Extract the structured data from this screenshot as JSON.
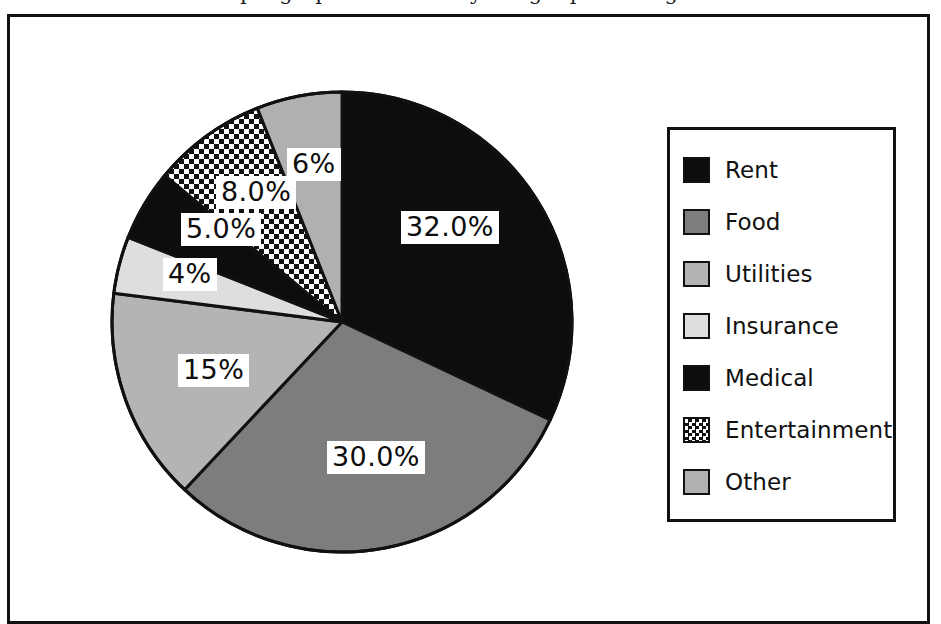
{
  "figure": {
    "clipped_title": "pie graph of a monthly budget percentages",
    "frame_color": "#111111",
    "background": "#ffffff"
  },
  "chart_data": {
    "type": "pie",
    "title": "",
    "xlabel": "",
    "ylabel": "",
    "grid": false,
    "legend_position": "right",
    "start_angle_deg": 90,
    "direction": "clockwise",
    "categories": [
      "Rent",
      "Food",
      "Utilities",
      "Insurance",
      "Medical",
      "Entertainment",
      "Other"
    ],
    "values": [
      32.0,
      30.0,
      15.0,
      4.0,
      5.0,
      8.0,
      6.0
    ],
    "labels": [
      "32.0%",
      "30.0%",
      "15%",
      "4%",
      "5.0%",
      "8.0%",
      "6%"
    ],
    "colors": [
      "#0d0d0d",
      "#7d7d7d",
      "#b4b4b4",
      "#dedede",
      "#0d0d0d",
      "#ffffff",
      "#b0b0b0"
    ],
    "patterns": [
      "solid",
      "solid",
      "solid",
      "solid",
      "solid",
      "checkerboard",
      "solid"
    ],
    "total": 100.0,
    "slices": [
      {
        "name": "Rent",
        "value": 32.0,
        "label": "32.0%",
        "color": "#0d0d0d",
        "pattern": "solid"
      },
      {
        "name": "Food",
        "value": 30.0,
        "label": "30.0%",
        "color": "#7d7d7d",
        "pattern": "solid"
      },
      {
        "name": "Utilities",
        "value": 15.0,
        "label": "15%",
        "color": "#b4b4b4",
        "pattern": "solid"
      },
      {
        "name": "Insurance",
        "value": 4.0,
        "label": "4%",
        "color": "#dedede",
        "pattern": "solid"
      },
      {
        "name": "Medical",
        "value": 5.0,
        "label": "5.0%",
        "color": "#0d0d0d",
        "pattern": "solid"
      },
      {
        "name": "Entertainment",
        "value": 8.0,
        "label": "8.0%",
        "color": "#ffffff",
        "pattern": "checkerboard"
      },
      {
        "name": "Other",
        "value": 6.0,
        "label": "6%",
        "color": "#b0b0b0",
        "pattern": "solid"
      }
    ]
  },
  "legend": {
    "items": [
      {
        "label": "Rent"
      },
      {
        "label": "Food"
      },
      {
        "label": "Utilities"
      },
      {
        "label": "Insurance"
      },
      {
        "label": "Medical"
      },
      {
        "label": "Entertainment"
      },
      {
        "label": "Other"
      }
    ]
  }
}
